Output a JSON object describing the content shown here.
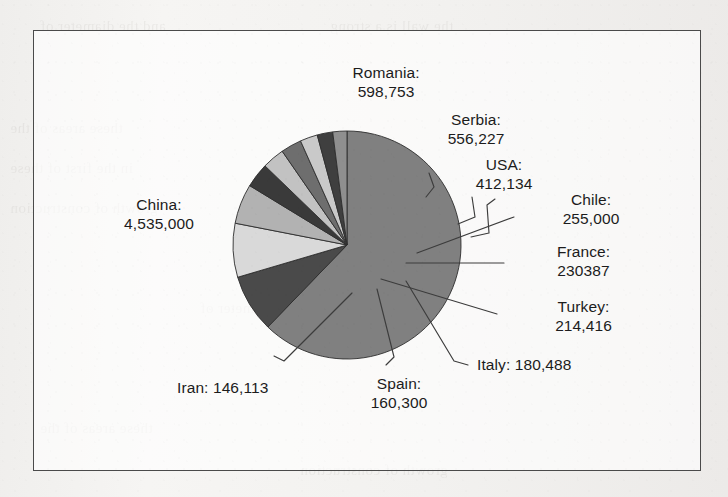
{
  "figure": {
    "frame_border_color": "#4a4a4a",
    "background_color": "#f2f1ef",
    "label_text_color": "#1c1c1c",
    "leader_line_color": "#3c3c3c"
  },
  "bleed_through_lines": [
    "and the diameter of",
    "the wall is a strong",
    "these areas of the",
    "in the first of these",
    "growth of construction"
  ],
  "chart_data": {
    "type": "pie",
    "title": "",
    "xlabel": "",
    "ylabel": "",
    "legend_position": "none",
    "labels_mode": "callout-leader-lines",
    "total": 7288828,
    "categories": [
      "China",
      "Romania",
      "Serbia",
      "USA",
      "Chile",
      "France",
      "Turkey",
      "Italy",
      "Spain",
      "Iran"
    ],
    "values": [
      4535000,
      598753,
      556227,
      412134,
      255000,
      230387,
      214416,
      180488,
      160300,
      146113
    ],
    "value_labels": [
      "4,535,000",
      "598,753",
      "556,227",
      "412,134",
      "255,000",
      "230387",
      "214,416",
      "180,488",
      "160,300",
      "146,113"
    ],
    "colors": [
      "#808080",
      "#4a4a4a",
      "#d9d9d9",
      "#b2b2b2",
      "#3a3a3a",
      "#c2c2c2",
      "#6e6e6e",
      "#c9c9c9",
      "#3f3f3f",
      "#8f8f8f"
    ],
    "slices": [
      {
        "name": "China",
        "label_line1": "China:",
        "label_line2": "4,535,000",
        "value": 4535000,
        "color": "#808080"
      },
      {
        "name": "Romania",
        "label_line1": "Romania:",
        "label_line2": "598,753",
        "value": 598753,
        "color": "#4a4a4a"
      },
      {
        "name": "Serbia",
        "label_line1": "Serbia:",
        "label_line2": "556,227",
        "value": 556227,
        "color": "#d9d9d9"
      },
      {
        "name": "USA",
        "label_line1": "USA:",
        "label_line2": "412,134",
        "value": 412134,
        "color": "#b2b2b2"
      },
      {
        "name": "Chile",
        "label_line1": "Chile:",
        "label_line2": "255,000",
        "value": 255000,
        "color": "#3a3a3a"
      },
      {
        "name": "France",
        "label_line1": "France:",
        "label_line2": "230387",
        "value": 230387,
        "color": "#c2c2c2"
      },
      {
        "name": "Turkey",
        "label_line1": "Turkey:",
        "label_line2": "214,416",
        "value": 214416,
        "color": "#6e6e6e"
      },
      {
        "name": "Italy",
        "label_line1": "Italy: 180,488",
        "label_line2": "",
        "value": 180488,
        "color": "#c9c9c9"
      },
      {
        "name": "Spain",
        "label_line1": "Spain:",
        "label_line2": "160,300",
        "value": 160300,
        "color": "#3f3f3f"
      },
      {
        "name": "Iran",
        "label_line1": "Iran: 146,113",
        "label_line2": "",
        "value": 146113,
        "color": "#8f8f8f"
      }
    ]
  }
}
